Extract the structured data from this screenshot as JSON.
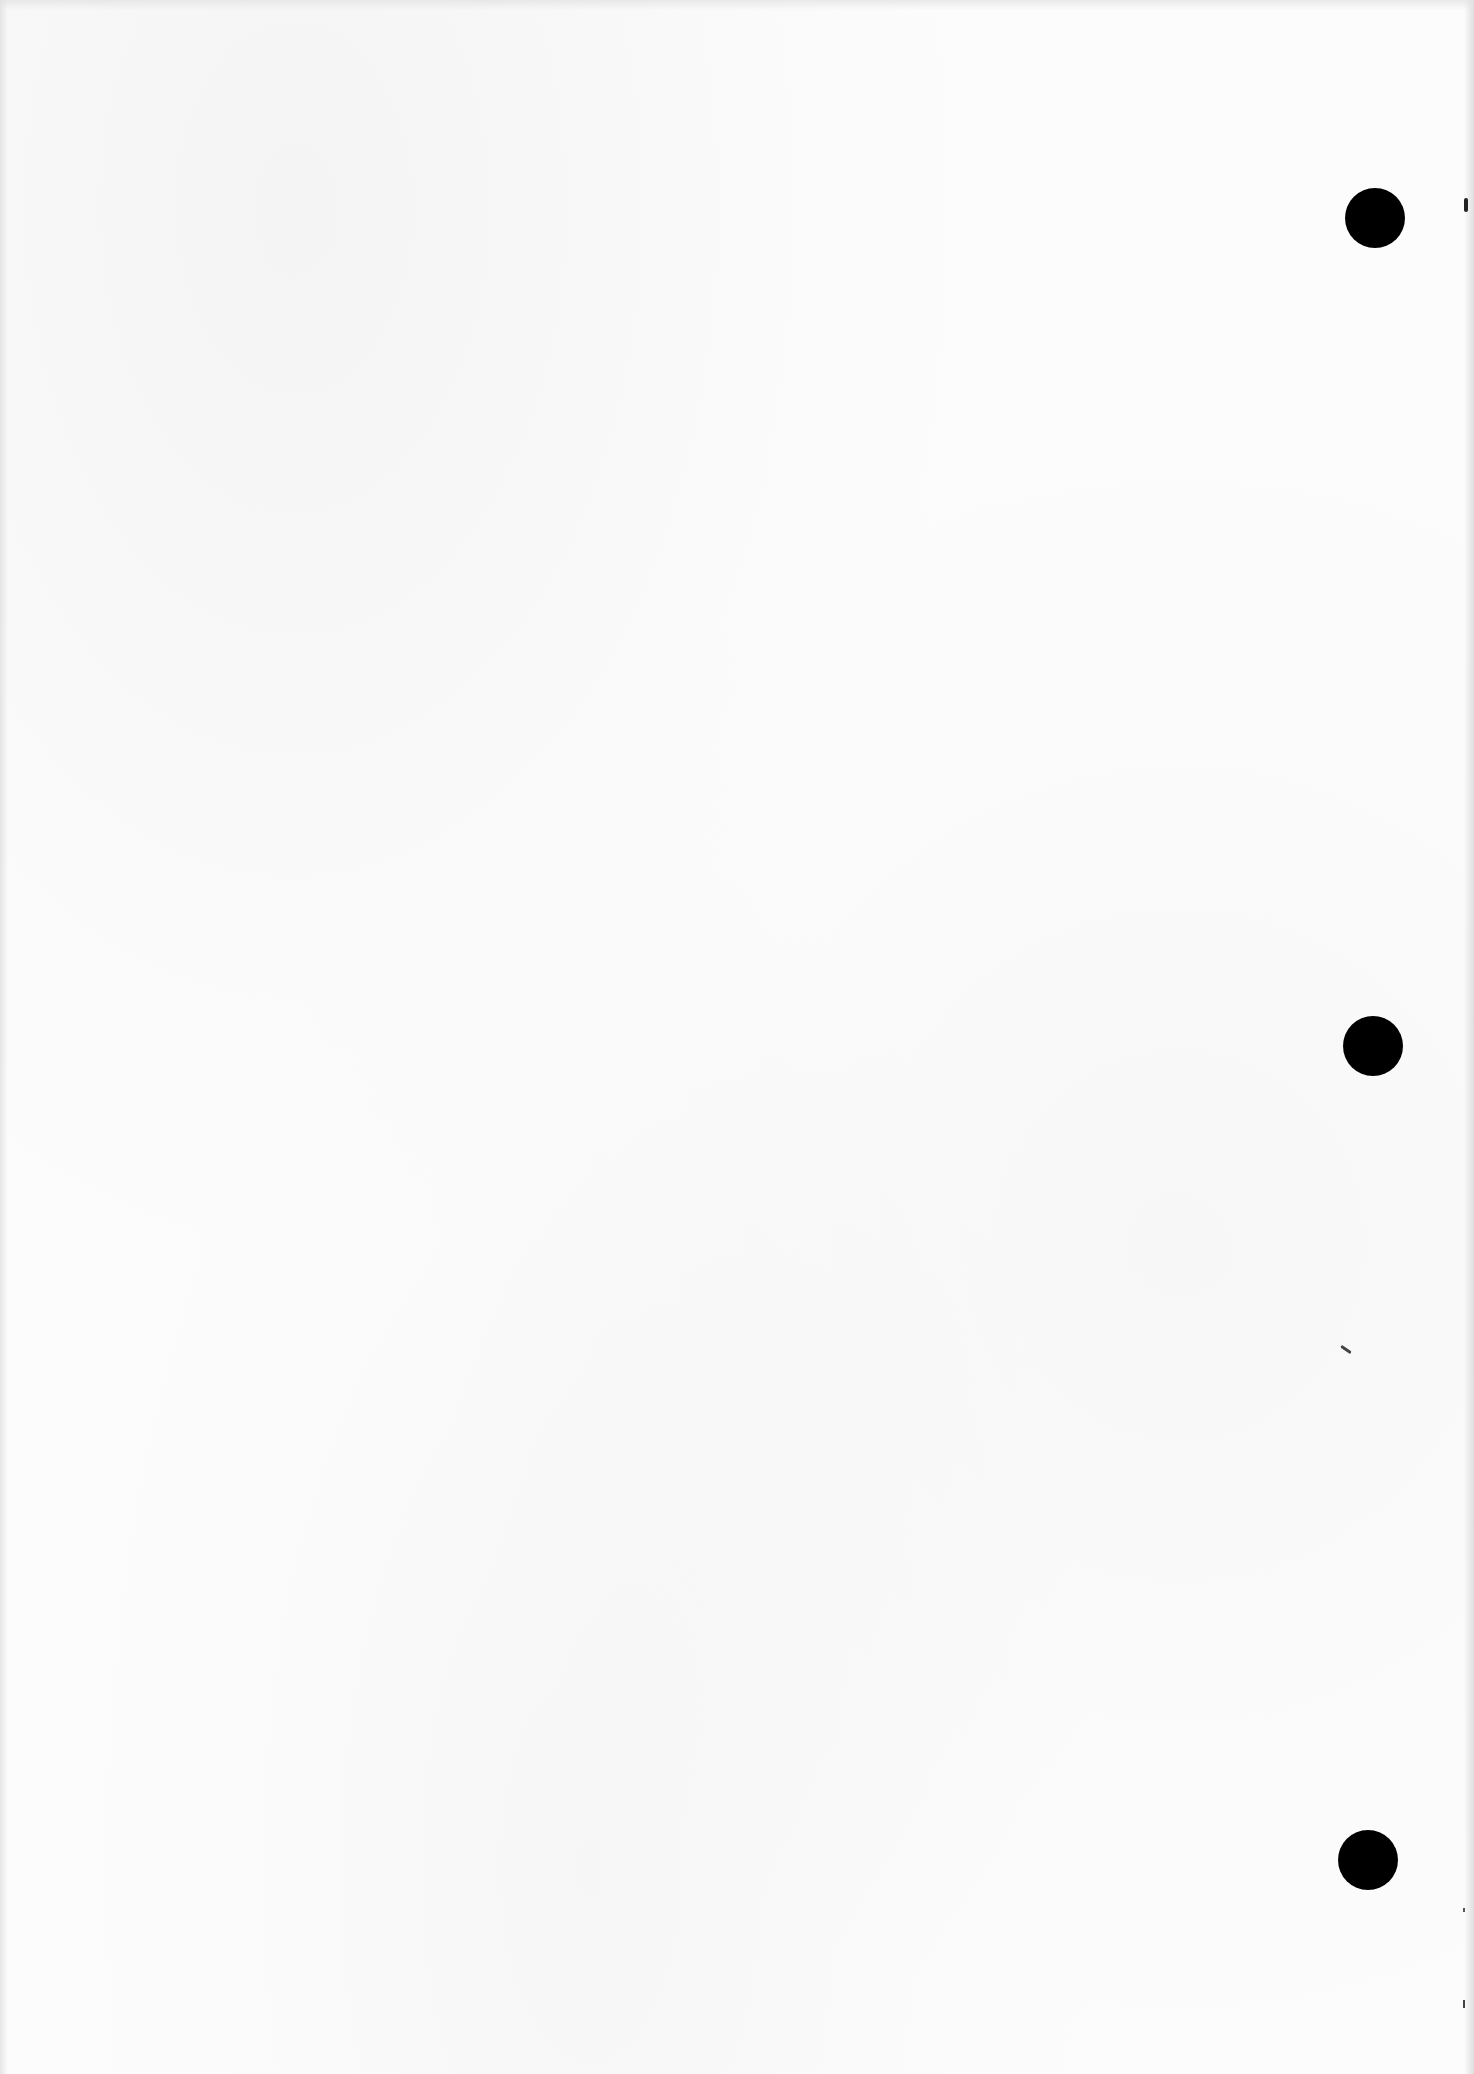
{
  "document": {
    "type": "blank scanned page",
    "text_content": "",
    "background_color": "#fcfcfc"
  },
  "punch_holes": [
    {
      "id": "top",
      "cx": 1375,
      "cy": 218,
      "diameter": 60,
      "color": "#000000"
    },
    {
      "id": "middle",
      "cx": 1373,
      "cy": 1046,
      "diameter": 60,
      "color": "#000000"
    },
    {
      "id": "bottom",
      "cx": 1368,
      "cy": 1860,
      "diameter": 60,
      "color": "#000000"
    }
  ],
  "marks": [
    {
      "id": "edge-mark-top",
      "x": 1464,
      "y": 198,
      "w": 4,
      "h": 14,
      "color": "#222222"
    },
    {
      "id": "stray-mark-middle",
      "x": 1340,
      "y": 1348,
      "w": 12,
      "h": 3,
      "rotate": 35,
      "color": "#444444"
    },
    {
      "id": "edge-speck-1",
      "x": 1463,
      "y": 1908,
      "w": 2,
      "h": 4,
      "color": "#555555"
    },
    {
      "id": "edge-speck-2",
      "x": 1463,
      "y": 2000,
      "w": 2,
      "h": 8,
      "color": "#444444"
    }
  ]
}
